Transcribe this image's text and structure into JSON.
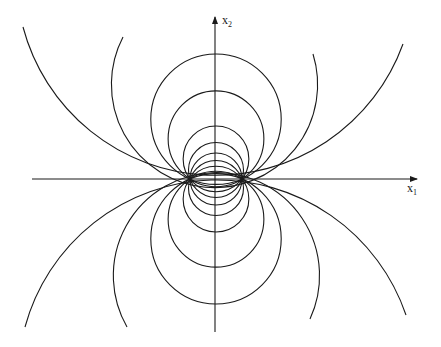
{
  "figure": {
    "line_color": "#1a1a1a",
    "background": "#ffffff",
    "axes": {
      "x_label": {
        "base": "x",
        "sub": "1"
      },
      "y_label": {
        "base": "x",
        "sub": "2"
      },
      "origin_px": [
        216,
        179
      ],
      "x_axis_px": {
        "from": 32,
        "to": 417
      },
      "y_axis_px": {
        "from": 332,
        "to": 17
      }
    },
    "foci_px": [
      [
        190,
        179
      ],
      [
        242,
        179
      ]
    ],
    "focal_half_distance_px": 26,
    "circle_center_offsets_px": [
      -59.8,
      -40.2,
      -20.1,
      -9,
      0,
      9,
      20.1,
      40.2,
      59.8
    ],
    "outer_arcs": [
      {
        "name": "outer-arc-top-1",
        "start": [
          23,
          27
        ],
        "end": [
          403,
          44
        ],
        "r": 199.3,
        "large": 0,
        "sweep": 0
      },
      {
        "name": "outer-arc-top-2",
        "start": [
          123,
          37
        ],
        "end": [
          313,
          54
        ],
        "r": 103.1,
        "large": 1,
        "sweep": 0
      },
      {
        "name": "outer-arc-bottom-1",
        "start": [
          25,
          327
        ],
        "end": [
          406,
          315
        ],
        "r": 199.3,
        "large": 0,
        "sweep": 1
      },
      {
        "name": "outer-arc-bottom-2",
        "start": [
          127,
          327
        ],
        "end": [
          310,
          319
        ],
        "r": 103.1,
        "large": 1,
        "sweep": 1
      }
    ]
  }
}
